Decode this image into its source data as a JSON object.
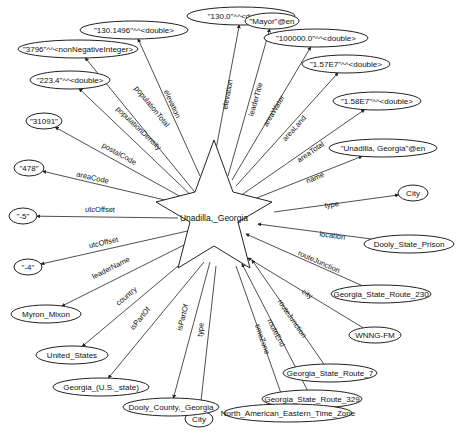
{
  "graph": {
    "center": {
      "label": "Unadilla,_Georgia",
      "x": 214,
      "y": 218
    },
    "edges": [
      {
        "predicate": "elevation",
        "target": "\"130.0\"^^<double>",
        "tx": 241,
        "ty": 16,
        "rx": 54,
        "ry": 9,
        "direction": "out",
        "sx": 214,
        "sy": 160,
        "lx": 230,
        "ly": 95
      },
      {
        "predicate": "elevation",
        "target": "\"130.1496\"^^<double>",
        "tx": 134,
        "ty": 30,
        "rx": 54,
        "ry": 9,
        "direction": "out",
        "sx": 200,
        "sy": 176,
        "lx": 170,
        "ly": 105
      },
      {
        "predicate": "leaderTitle",
        "target": "\"Mayor\"@en",
        "tx": 272,
        "ty": 21,
        "rx": 27,
        "ry": 8,
        "direction": "out",
        "sx": 228,
        "sy": 176,
        "lx": 258,
        "ly": 100
      },
      {
        "predicate": "areaWater",
        "target": "\"100000.0\"^^<double>",
        "tx": 316,
        "ty": 38,
        "rx": 52,
        "ry": 9,
        "direction": "out",
        "sx": 232,
        "sy": 180,
        "lx": 276,
        "ly": 112
      },
      {
        "predicate": "areaLand",
        "target": "\"1.57E7\"^^<double>",
        "tx": 346,
        "ty": 64,
        "rx": 44,
        "ry": 9,
        "direction": "out",
        "sx": 236,
        "sy": 186,
        "lx": 296,
        "ly": 130
      },
      {
        "predicate": "areaTotal",
        "target": "\"1.58E7\"^^<double>",
        "tx": 377,
        "ty": 101,
        "rx": 44,
        "ry": 9,
        "direction": "out",
        "sx": 240,
        "sy": 196,
        "lx": 312,
        "ly": 154
      },
      {
        "predicate": "name",
        "target": "\"Unadilla, Georgia\"@en",
        "tx": 383,
        "ty": 148,
        "rx": 54,
        "ry": 9,
        "direction": "out",
        "sx": 244,
        "sy": 203,
        "lx": 316,
        "ly": 180
      },
      {
        "predicate": "type",
        "target": "City",
        "tx": 413,
        "ty": 193,
        "rx": 15,
        "ry": 8,
        "direction": "out",
        "sx": 274,
        "sy": 212,
        "lx": 332,
        "ly": 207
      },
      {
        "predicate": "location",
        "target": "Dooly_State_Prison",
        "tx": 409,
        "ty": 244,
        "rx": 45,
        "ry": 9,
        "direction": "in",
        "sx": 258,
        "sy": 224,
        "lx": 332,
        "ly": 238
      },
      {
        "predicate": "routeJunction",
        "target": "Georgia_State_Route_230",
        "tx": 381,
        "ty": 294,
        "rx": 50,
        "ry": 9,
        "direction": "in",
        "sx": 246,
        "sy": 234,
        "lx": 318,
        "ly": 264
      },
      {
        "predicate": "city",
        "target": "WNNG-FM",
        "tx": 375,
        "ty": 335,
        "rx": 26,
        "ry": 8,
        "direction": "in",
        "sx": 248,
        "sy": 258,
        "lx": 306,
        "ly": 296
      },
      {
        "predicate": "routeJunction",
        "target": "Georgia_State_Route_7",
        "tx": 330,
        "ty": 373,
        "rx": 47,
        "ry": 9,
        "direction": "in",
        "sx": 252,
        "sy": 260,
        "lx": 290,
        "ly": 320
      },
      {
        "predicate": "routeEnd",
        "target": "Georgia_State_Route_329",
        "tx": 312,
        "ty": 399,
        "rx": 50,
        "ry": 9,
        "direction": "in",
        "sx": 242,
        "sy": 264,
        "lx": 274,
        "ly": 334
      },
      {
        "predicate": "timeZone",
        "target": "North_American_Eastern_Time_Zone",
        "tx": 288,
        "ty": 413,
        "rx": 64,
        "ry": 9,
        "direction": "out",
        "sx": 236,
        "sy": 266,
        "lx": 260,
        "ly": 340
      },
      {
        "predicate": "type",
        "target": "City",
        "tx": 199,
        "ty": 419,
        "rx": 14,
        "ry": 8,
        "direction": "out",
        "sx": 216,
        "sy": 266,
        "lx": 203,
        "ly": 330
      },
      {
        "predicate": "isPartOf",
        "target": "Dooly_County,_Georgia",
        "tx": 171,
        "ty": 407,
        "rx": 48,
        "ry": 9,
        "direction": "out",
        "sx": 210,
        "sy": 262,
        "lx": 185,
        "ly": 318
      },
      {
        "predicate": "isPartOf",
        "target": "Georgia_(U.S._state)",
        "tx": 101,
        "ty": 387,
        "rx": 48,
        "ry": 9,
        "direction": "out",
        "sx": 204,
        "sy": 262,
        "lx": 142,
        "ly": 320
      },
      {
        "predicate": "country",
        "target": "United_States",
        "tx": 72,
        "ty": 355,
        "rx": 36,
        "ry": 9,
        "direction": "out",
        "sx": 190,
        "sy": 256,
        "lx": 128,
        "ly": 298
      },
      {
        "predicate": "leaderName",
        "target": "Myron_Mixon",
        "tx": 46,
        "ty": 314,
        "rx": 35,
        "ry": 9,
        "direction": "out",
        "sx": 190,
        "sy": 242,
        "lx": 112,
        "ly": 270
      },
      {
        "predicate": "utcOffset",
        "target": "\"-4\"",
        "tx": 28,
        "ty": 267,
        "rx": 14,
        "ry": 8,
        "direction": "out",
        "sx": 192,
        "sy": 230,
        "lx": 104,
        "ly": 245
      },
      {
        "predicate": "utcOffset",
        "target": "\"-5\"",
        "tx": 23,
        "ty": 216,
        "rx": 14,
        "ry": 8,
        "direction": "out",
        "sx": 178,
        "sy": 218,
        "lx": 100,
        "ly": 212
      },
      {
        "predicate": "areaCode",
        "target": "\"478\"",
        "tx": 29,
        "ty": 168,
        "rx": 15,
        "ry": 8,
        "direction": "out",
        "sx": 186,
        "sy": 205,
        "lx": 92,
        "ly": 180
      },
      {
        "predicate": "postalCode",
        "target": "\"31091\"",
        "tx": 44,
        "ty": 121,
        "rx": 18,
        "ry": 8,
        "direction": "out",
        "sx": 192,
        "sy": 203,
        "lx": 118,
        "ly": 156
      },
      {
        "predicate": "populationDensity",
        "target": "\"223.4\"^^<double>",
        "tx": 70,
        "ty": 80,
        "rx": 40,
        "ry": 9,
        "direction": "out",
        "sx": 196,
        "sy": 200,
        "lx": 137,
        "ly": 130
      },
      {
        "predicate": "populationTotal",
        "target": "\"3796\"^^<nonNegativeInteger>",
        "tx": 78,
        "ty": 49,
        "rx": 60,
        "ry": 9,
        "direction": "out",
        "sx": 198,
        "sy": 196,
        "lx": 150,
        "ly": 108
      }
    ]
  }
}
